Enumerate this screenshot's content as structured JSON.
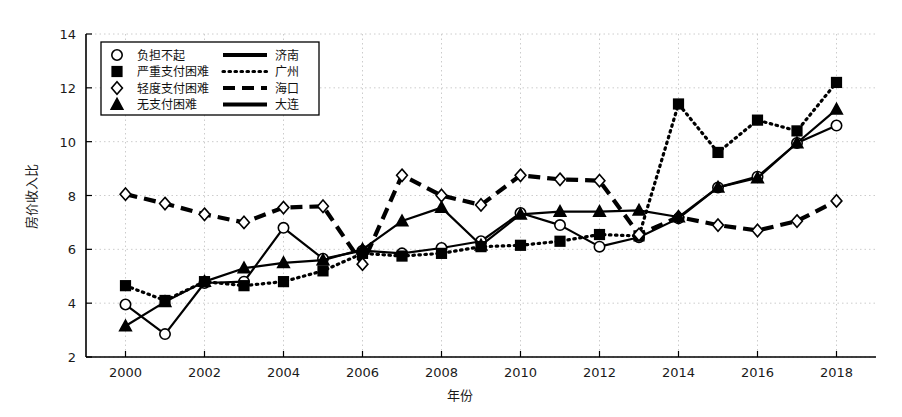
{
  "chart_data": {
    "type": "line",
    "title": "",
    "xlabel": "年份",
    "ylabel": "房价收入比",
    "xlim": [
      1999,
      2019
    ],
    "ylim": [
      2,
      14
    ],
    "ytick_step": 2,
    "xtick_step": 2,
    "grid": true,
    "legend_position": "top-left",
    "x": [
      2000,
      2001,
      2002,
      2003,
      2004,
      2005,
      2006,
      2007,
      2008,
      2009,
      2010,
      2011,
      2012,
      2013,
      2014,
      2015,
      2016,
      2017,
      2018
    ],
    "xticklabels": [
      "2000",
      "2002",
      "2004",
      "2006",
      "2008",
      "2010",
      "2012",
      "2014",
      "2016",
      "2018"
    ],
    "yticklabels": [
      "2",
      "4",
      "6",
      "8",
      "10",
      "12",
      "14"
    ],
    "series": [
      {
        "name": "济南",
        "marker": "负担不起",
        "marker_shape": "circle",
        "line_style": "solid-thick",
        "color": "#000000",
        "values": [
          3.95,
          2.85,
          4.75,
          4.8,
          6.8,
          5.65,
          5.95,
          5.85,
          6.05,
          6.3,
          7.35,
          6.9,
          6.1,
          6.45,
          7.15,
          8.3,
          8.7,
          9.95,
          10.6
        ]
      },
      {
        "name": "广州",
        "marker": "严重支付困难",
        "marker_shape": "square",
        "line_style": "dotted",
        "color": "#000000",
        "values": [
          4.65,
          4.1,
          4.8,
          4.65,
          4.8,
          5.2,
          5.85,
          5.75,
          5.85,
          6.1,
          6.15,
          6.3,
          6.55,
          6.5,
          11.4,
          9.6,
          10.8,
          10.4,
          12.2
        ]
      },
      {
        "name": "海口",
        "marker": "轻度支付困难",
        "marker_shape": "diamond",
        "line_style": "dashed",
        "color": "#000000",
        "values": [
          8.05,
          7.7,
          7.3,
          7.0,
          7.55,
          7.6,
          5.45,
          8.75,
          8.0,
          7.65,
          8.75,
          8.6,
          8.55,
          6.55,
          7.2,
          6.9,
          6.7,
          7.05,
          7.8
        ]
      },
      {
        "name": "大连",
        "marker": "无支付困难",
        "marker_shape": "triangle",
        "line_style": "solid",
        "color": "#000000",
        "values": [
          3.15,
          4.05,
          4.8,
          5.3,
          5.5,
          5.6,
          6.0,
          7.05,
          7.55,
          6.15,
          7.3,
          7.4,
          7.4,
          7.45,
          7.2,
          8.3,
          8.65,
          9.95,
          11.2
        ]
      }
    ]
  },
  "legend": {
    "rows": [
      {
        "marker_shape": "circle",
        "marker_label": "负担不起",
        "line_style": "solid-thick",
        "series_label": "济南"
      },
      {
        "marker_shape": "square",
        "marker_label": "严重支付困难",
        "line_style": "dotted",
        "series_label": "广州"
      },
      {
        "marker_shape": "diamond",
        "marker_label": "轻度支付困难",
        "line_style": "dashed",
        "series_label": "海口"
      },
      {
        "marker_shape": "triangle",
        "marker_label": "无支付困难",
        "line_style": "solid",
        "series_label": "大连"
      }
    ]
  },
  "style": {
    "axis_color": "#000000",
    "grid_color": "#cccccc",
    "background": "#ffffff"
  }
}
